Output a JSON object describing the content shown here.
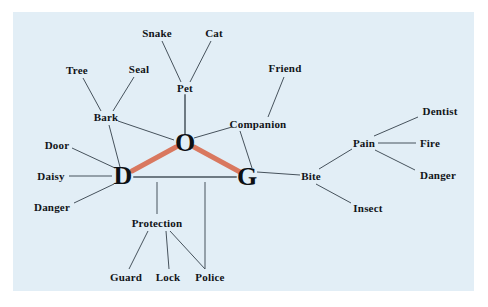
{
  "figure": {
    "title": "",
    "panel_bg": "#e2eef6",
    "page_bg": "#ffffff",
    "text_color": "#111418",
    "edge_color": "#6e7a83",
    "highlight_color": "#d9785f"
  },
  "nodes": {
    "core": [
      {
        "id": "D",
        "label": "D",
        "x": 123,
        "y": 176
      },
      {
        "id": "O",
        "label": "O",
        "x": 185,
        "y": 143
      },
      {
        "id": "G",
        "label": "G",
        "x": 247,
        "y": 177
      }
    ],
    "concepts": [
      {
        "id": "snake",
        "label": "Snake",
        "x": 157,
        "y": 33
      },
      {
        "id": "cat",
        "label": "Cat",
        "x": 214,
        "y": 33
      },
      {
        "id": "tree",
        "label": "Tree",
        "x": 77,
        "y": 70
      },
      {
        "id": "seal",
        "label": "Seal",
        "x": 139,
        "y": 69
      },
      {
        "id": "pet",
        "label": "Pet",
        "x": 185,
        "y": 88
      },
      {
        "id": "friend",
        "label": "Friend",
        "x": 285,
        "y": 68
      },
      {
        "id": "bark",
        "label": "Bark",
        "x": 106,
        "y": 117
      },
      {
        "id": "companion",
        "label": "Companion",
        "x": 258,
        "y": 124
      },
      {
        "id": "door",
        "label": "Door",
        "x": 57,
        "y": 145
      },
      {
        "id": "daisy",
        "label": "Daisy",
        "x": 51,
        "y": 176
      },
      {
        "id": "danger_l",
        "label": "Danger",
        "x": 52,
        "y": 207
      },
      {
        "id": "bite",
        "label": "Bite",
        "x": 311,
        "y": 176
      },
      {
        "id": "pain",
        "label": "Pain",
        "x": 364,
        "y": 143
      },
      {
        "id": "dentist",
        "label": "Dentist",
        "x": 440,
        "y": 111
      },
      {
        "id": "fire",
        "label": "Fire",
        "x": 430,
        "y": 143
      },
      {
        "id": "danger_r",
        "label": "Danger",
        "x": 438,
        "y": 175
      },
      {
        "id": "insect",
        "label": "Insect",
        "x": 368,
        "y": 208
      },
      {
        "id": "protection",
        "label": "Protection",
        "x": 157,
        "y": 223
      },
      {
        "id": "guard",
        "label": "Guard",
        "x": 126,
        "y": 277
      },
      {
        "id": "lock",
        "label": "Lock",
        "x": 168,
        "y": 277
      },
      {
        "id": "police",
        "label": "Police",
        "x": 210,
        "y": 277
      }
    ]
  },
  "edges": [
    {
      "from": "D",
      "to": "O",
      "style": "highlight",
      "x1": 132,
      "y1": 171,
      "x2": 176,
      "y2": 147
    },
    {
      "from": "O",
      "to": "G",
      "style": "highlight",
      "x1": 194,
      "y1": 147,
      "x2": 240,
      "y2": 172
    },
    {
      "from": "D",
      "to": "G",
      "style": "thick",
      "x1": 134,
      "y1": 177,
      "x2": 236,
      "y2": 177
    },
    {
      "from": "O",
      "to": "pet",
      "style": "thick",
      "x1": 185,
      "y1": 134,
      "x2": 185,
      "y2": 95
    },
    {
      "from": "pet",
      "to": "snake",
      "style": "thin",
      "x1": 181,
      "y1": 82,
      "x2": 162,
      "y2": 41
    },
    {
      "from": "pet",
      "to": "cat",
      "style": "thin",
      "x1": 190,
      "y1": 82,
      "x2": 211,
      "y2": 41
    },
    {
      "from": "bark",
      "to": "tree",
      "style": "thin",
      "x1": 101,
      "y1": 111,
      "x2": 83,
      "y2": 78
    },
    {
      "from": "bark",
      "to": "seal",
      "style": "thin",
      "x1": 113,
      "y1": 111,
      "x2": 134,
      "y2": 77
    },
    {
      "from": "bark",
      "to": "O",
      "style": "thin",
      "x1": 118,
      "y1": 121,
      "x2": 174,
      "y2": 140
    },
    {
      "from": "O",
      "to": "companion",
      "style": "thin",
      "x1": 194,
      "y1": 138,
      "x2": 232,
      "y2": 127
    },
    {
      "from": "companion",
      "to": "friend",
      "style": "thin",
      "x1": 268,
      "y1": 117,
      "x2": 284,
      "y2": 77
    },
    {
      "from": "G",
      "to": "companion",
      "style": "thin",
      "x1": 252,
      "y1": 168,
      "x2": 240,
      "y2": 131
    },
    {
      "from": "D",
      "to": "door",
      "style": "thin",
      "x1": 115,
      "y1": 168,
      "x2": 72,
      "y2": 148
    },
    {
      "from": "D",
      "to": "daisy",
      "style": "thin",
      "x1": 112,
      "y1": 176,
      "x2": 69,
      "y2": 176
    },
    {
      "from": "D",
      "to": "danger_l",
      "style": "thin",
      "x1": 114,
      "y1": 184,
      "x2": 74,
      "y2": 203
    },
    {
      "from": "D",
      "to": "bark",
      "style": "thin",
      "x1": 120,
      "y1": 167,
      "x2": 109,
      "y2": 125
    },
    {
      "from": "G",
      "to": "bite",
      "style": "thin",
      "x1": 257,
      "y1": 172,
      "x2": 300,
      "y2": 175
    },
    {
      "from": "bite",
      "to": "pain",
      "style": "thin",
      "x1": 319,
      "y1": 169,
      "x2": 352,
      "y2": 149
    },
    {
      "from": "bite",
      "to": "insect",
      "style": "thin",
      "x1": 316,
      "y1": 184,
      "x2": 351,
      "y2": 203
    },
    {
      "from": "pain",
      "to": "dentist",
      "style": "thin",
      "x1": 374,
      "y1": 136,
      "x2": 418,
      "y2": 117
    },
    {
      "from": "pain",
      "to": "fire",
      "style": "thin",
      "x1": 378,
      "y1": 143,
      "x2": 416,
      "y2": 143
    },
    {
      "from": "pain",
      "to": "danger_r",
      "style": "thin",
      "x1": 375,
      "y1": 150,
      "x2": 415,
      "y2": 170
    },
    {
      "from": "dline1",
      "to": "protection",
      "style": "thin",
      "x1": 157,
      "y1": 182,
      "x2": 157,
      "y2": 214
    },
    {
      "from": "dline2",
      "to": "gline",
      "style": "thin",
      "x1": 205,
      "y1": 182,
      "x2": 205,
      "y2": 269
    },
    {
      "from": "protection",
      "to": "guard",
      "style": "thin",
      "x1": 148,
      "y1": 231,
      "x2": 129,
      "y2": 269
    },
    {
      "from": "protection",
      "to": "lock",
      "style": "thin",
      "x1": 166,
      "y1": 231,
      "x2": 169,
      "y2": 269
    },
    {
      "from": "protection",
      "to": "police",
      "style": "thin",
      "x1": 170,
      "y1": 231,
      "x2": 205,
      "y2": 269
    }
  ]
}
